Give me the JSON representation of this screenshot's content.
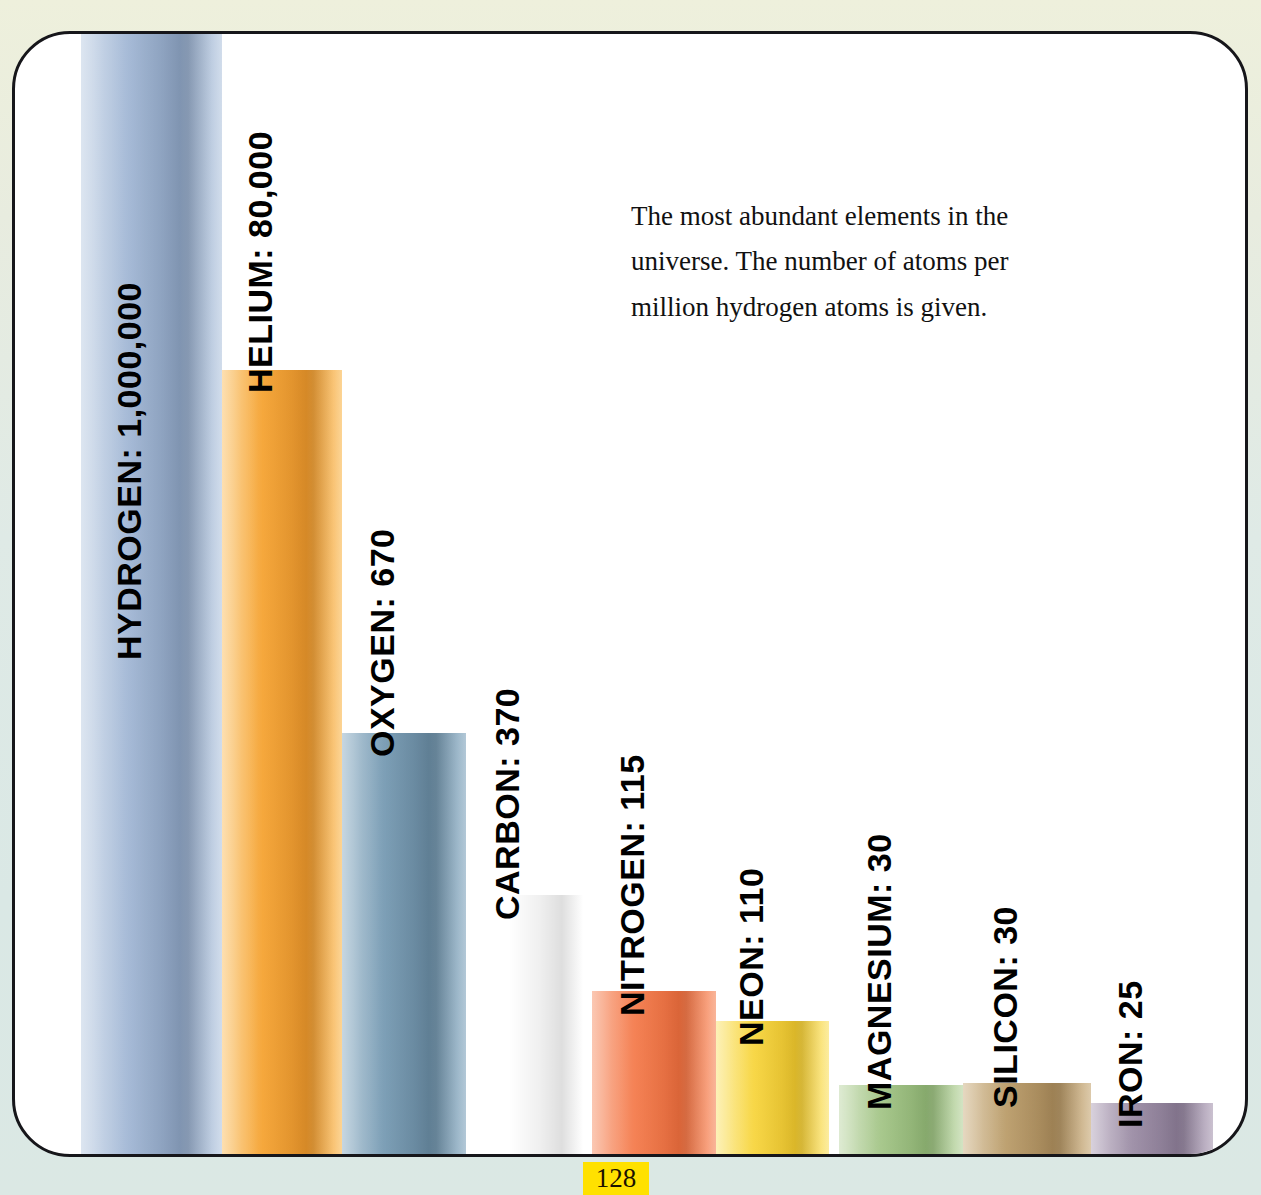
{
  "page": {
    "number": "128",
    "background_top_color": "#eef0dc",
    "background_bottom_color": "#dae8e5",
    "frame_border_color": "#16161a",
    "page_badge_color": "#ffe100"
  },
  "caption": {
    "text": "The most abundant elements in the universe. The number of atoms per million hydrogen atoms is given."
  },
  "chart_data": {
    "type": "bar",
    "title": "The most abundant elements in the universe",
    "subtitle": "The number of atoms per million hydrogen atoms is given.",
    "xlabel": "",
    "ylabel": "Atoms per million hydrogen atoms",
    "scale": "non-linear (illustrative pictorial scale)",
    "grid": false,
    "legend": false,
    "categories": [
      "HYDROGEN",
      "HELIUM",
      "OXYGEN",
      "CARBON",
      "NITROGEN",
      "NEON",
      "MAGNESIUM",
      "SILICON",
      "IRON"
    ],
    "values": [
      1000000,
      80000,
      670,
      370,
      115,
      110,
      30,
      30,
      25
    ],
    "value_labels": [
      "1,000,000",
      "80,000",
      "670",
      "370",
      "115",
      "110",
      "30",
      "30",
      "25"
    ],
    "bars": [
      {
        "name": "HYDROGEN",
        "label": "HYDROGEN: 1,000,000",
        "value": 1000000,
        "value_label": "1,000,000",
        "color": "#a8bcd8",
        "color_light": "#c4d3e6",
        "color_dark": "#8fa6c6",
        "label_on_bar": true
      },
      {
        "name": "HELIUM",
        "label": "HELIUM: 80,000",
        "value": 80000,
        "value_label": "80,000",
        "color": "#f6a93e",
        "color_light": "#fbc877",
        "color_dark": "#ef992b",
        "label_on_bar": false
      },
      {
        "name": "OXYGEN",
        "label": "OXYGEN: 670",
        "value": 670,
        "value_label": "670",
        "color": "#7fa1b8",
        "color_light": "#9db9cc",
        "color_dark": "#6b8ea6",
        "label_on_bar": false
      },
      {
        "name": "CARBON",
        "label": "CARBON: 370",
        "value": 370,
        "value_label": "370",
        "color": "#d2a濁76",
        "color_light": "#e2bd91",
        "color_dark": "#c49a64",
        "label_on_bar": false
      },
      {
        "name": "NITROGEN",
        "label": "NITROGEN: 115",
        "value": 115,
        "value_label": "115",
        "color": "#f58458",
        "color_light": "#f8a07c",
        "color_dark": "#f4713f",
        "label_on_bar": false
      },
      {
        "name": "NEON",
        "label": "NEON: 110",
        "value": 110,
        "value_label": "110",
        "color": "#f8d84a",
        "color_light": "#fbe784",
        "color_dark": "#f4cc2e",
        "label_on_bar": false
      },
      {
        "name": "MAGNESIUM",
        "label": "MAGNESIUM: 30",
        "value": 30,
        "value_label": "30",
        "color": "#aac98f",
        "color_light": "#c6dcb2",
        "color_dark": "#96bd79",
        "label_on_bar": false
      },
      {
        "name": "SILICON",
        "label": "SILICON: 30",
        "value": 30,
        "value_label": "30",
        "color": "#bfa373",
        "color_light": "#d3bb93",
        "color_dark": "#b0905e",
        "label_on_bar": false
      },
      {
        "name": "IRON",
        "label": "IRON: 25",
        "value": 25,
        "value_label": "25",
        "color": "#a294ab",
        "color_light": "#bcb0c3",
        "color_dark": "#91819c",
        "label_on_bar": false
      }
    ]
  },
  "layout": {
    "bars_px": [
      {
        "left": 66,
        "width": 141,
        "top": 0,
        "label_baseline_y": 592
      },
      {
        "left": 207,
        "width": 120,
        "top": 336,
        "label_baseline_y": 325
      },
      {
        "left": 327,
        "width": 124,
        "top": 699,
        "label_baseline_y": 689
      },
      {
        "left": 451,
        "width": 126,
        "top": 861,
        "label_baseline_y": 852
      },
      {
        "left": 577,
        "width": 124,
        "top": 957,
        "label_baseline_y": 948
      },
      {
        "left": 701,
        "width": 113,
        "top": 987,
        "label_baseline_y": 978
      },
      {
        "left": 824,
        "width": 124,
        "top": 1051,
        "label_baseline_y": 1042
      },
      {
        "left": 948,
        "width": 128,
        "top": 1049,
        "label_baseline_y": 1040
      },
      {
        "left": 1076,
        "width": 122,
        "top": 1069,
        "label_baseline_y": 1060
      }
    ]
  }
}
